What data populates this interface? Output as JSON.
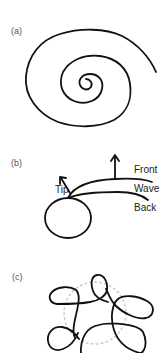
{
  "panels": [
    {
      "label": "(a)",
      "content": "spiral"
    },
    {
      "label": "(b)",
      "content": "spiral-wave-tip",
      "annotations": {
        "tip": "Tip",
        "front": "Front",
        "wave": "Wave",
        "back": "Back"
      }
    },
    {
      "label": "(c)",
      "content": "meandering-tip-trajectory"
    }
  ],
  "colors": {
    "stroke": "#111111",
    "dashed_circle": "#c8c8c8",
    "label": "#555555"
  }
}
